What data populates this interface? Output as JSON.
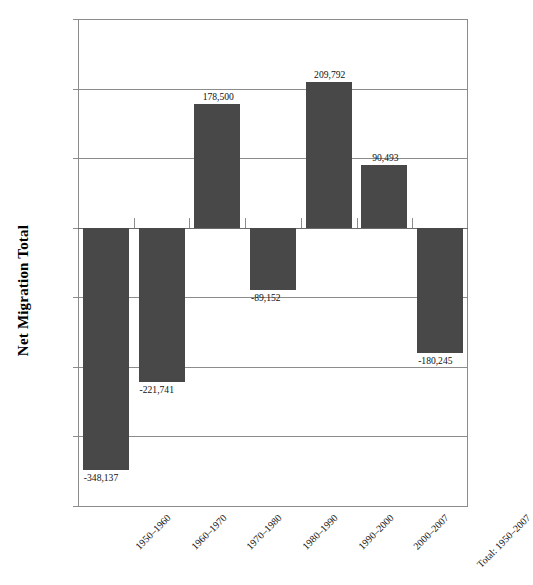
{
  "chart_data": {
    "type": "bar",
    "title": "",
    "xlabel": "",
    "ylabel": "Net Migration Total",
    "categories": [
      "1950–1960",
      "1960–1970",
      "1970–1980",
      "1980–1990",
      "1990–2000",
      "2000–2007",
      "Total: 1950–2007"
    ],
    "values": [
      -348137,
      -221741,
      178500,
      -89152,
      209792,
      90493,
      -180245
    ],
    "value_labels": [
      "-348,137",
      "-221,741",
      "178,500",
      "-89,152",
      "209,792",
      "90,493",
      "-180,245"
    ],
    "ylim": [
      -400000,
      300000
    ],
    "ytick_values": [
      300000,
      200000,
      100000,
      0,
      -100000,
      -200000,
      -300000,
      -400000
    ],
    "ytick_labels": [
      "300,000",
      "200,000",
      "100,000",
      "0",
      "-100,000",
      "-200,000",
      "-300,000",
      "-400,000"
    ],
    "grid": true,
    "legend": false,
    "series_color": "#484848",
    "gridline_color": "#8c8c8c",
    "axis_text_color": "#111111"
  }
}
